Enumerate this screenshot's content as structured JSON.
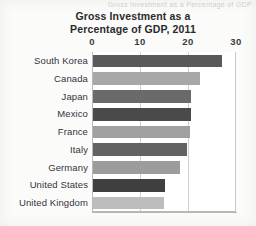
{
  "figure": {
    "background_color": "#fbfbfa",
    "clipped_header_text": "Gross Investment as a Percentage of GDP"
  },
  "chart_data": {
    "type": "bar",
    "orientation": "horizontal",
    "title": "Gross Investment as a Percentage of GDP, 2011",
    "title_lines": [
      "Gross Investment as a",
      "Percentage of GDP, 2011"
    ],
    "xlabel": "",
    "ylabel": "",
    "xlim": [
      0,
      30
    ],
    "xticks": [
      0,
      10,
      20,
      30
    ],
    "xtick_labels": [
      "0",
      "10",
      "20",
      "30"
    ],
    "grid": true,
    "grid_axis": "x",
    "legend": "none",
    "categories": [
      "South Korea",
      "Canada",
      "Japan",
      "Mexico",
      "France",
      "Italy",
      "Germany",
      "United States",
      "United Kingdom"
    ],
    "values": [
      26.9,
      22.3,
      20.5,
      20.4,
      20.3,
      19.6,
      18.1,
      15.0,
      14.8
    ],
    "bar_colors": [
      "#595959",
      "#a8a8a8",
      "#6a6a6a",
      "#4a4a4a",
      "#a0a0a0",
      "#636363",
      "#9c9c9c",
      "#3f3f3f",
      "#bdbdbd"
    ]
  },
  "colors": {
    "text": "#34343a",
    "title": "#2a2a2c",
    "gridline": "#cfcfcc",
    "axis": "#b9b9b6",
    "plot_background": "#ffffff"
  }
}
